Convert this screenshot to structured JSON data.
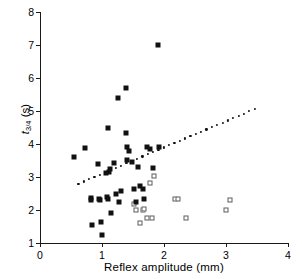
{
  "chart_data": {
    "type": "scatter",
    "title": "",
    "xlabel": "Reflex amplitude (mm)",
    "ylabel_parts": {
      "symbol": "t",
      "subscript": "3/4",
      "units": "(s)"
    },
    "ylabel": "t3/4 (s)",
    "xlim": [
      0,
      4
    ],
    "ylim": [
      1,
      8
    ],
    "xticks": [
      0,
      1,
      2,
      3,
      4
    ],
    "yticks": [
      1,
      2,
      3,
      4,
      5,
      6,
      7,
      8
    ],
    "xtick_labels": [
      "0",
      "1",
      "2",
      "3",
      "4"
    ],
    "ytick_labels": [
      "1",
      "2",
      "3",
      "4",
      "5",
      "6",
      "7",
      "8"
    ],
    "grid": false,
    "legend_position": "none",
    "series": [
      {
        "name": "filled-squares",
        "marker": "filled square",
        "color": "#111111",
        "points": [
          [
            0.55,
            3.6
          ],
          [
            0.72,
            3.89
          ],
          [
            0.82,
            2.35
          ],
          [
            0.83,
            2.3
          ],
          [
            0.84,
            1.55
          ],
          [
            0.93,
            3.38
          ],
          [
            0.95,
            2.32
          ],
          [
            0.97,
            2.3
          ],
          [
            0.98,
            1.64
          ],
          [
            1.0,
            1.25
          ],
          [
            1.07,
            3.11
          ],
          [
            1.08,
            2.38
          ],
          [
            1.09,
            2.33
          ],
          [
            1.1,
            4.49
          ],
          [
            1.12,
            3.16
          ],
          [
            1.13,
            3.25
          ],
          [
            1.14,
            1.9
          ],
          [
            1.2,
            3.43
          ],
          [
            1.22,
            2.49
          ],
          [
            1.25,
            5.38
          ],
          [
            1.27,
            2.25
          ],
          [
            1.3,
            2.58
          ],
          [
            1.38,
            5.7
          ],
          [
            1.39,
            4.34
          ],
          [
            1.4,
            3.9
          ],
          [
            1.41,
            3.52
          ],
          [
            1.43,
            3.79
          ],
          [
            1.48,
            3.46
          ],
          [
            1.52,
            2.64
          ],
          [
            1.55,
            2.25
          ],
          [
            1.58,
            3.3
          ],
          [
            1.62,
            2.72
          ],
          [
            1.66,
            2.64
          ],
          [
            1.68,
            2.33
          ],
          [
            1.72,
            3.92
          ],
          [
            1.78,
            3.84
          ],
          [
            1.82,
            3.28
          ],
          [
            1.9,
            7.0
          ],
          [
            1.92,
            3.9
          ]
        ]
      },
      {
        "name": "open-squares",
        "marker": "open square",
        "color": "#5d5d5d",
        "points": [
          [
            1.52,
            2.17
          ],
          [
            1.55,
            2.0
          ],
          [
            1.62,
            1.62
          ],
          [
            1.66,
            2.0
          ],
          [
            1.68,
            2.02
          ],
          [
            1.72,
            1.77
          ],
          [
            1.78,
            2.82
          ],
          [
            1.8,
            1.76
          ],
          [
            1.84,
            3.03
          ],
          [
            2.18,
            2.34
          ],
          [
            2.22,
            2.34
          ],
          [
            2.35,
            1.77
          ],
          [
            3.0,
            2.0
          ],
          [
            3.07,
            2.31
          ]
        ]
      }
    ],
    "fit_line": {
      "name": "regression-line",
      "style": "dotted",
      "x_start": 0.62,
      "y_start": 2.8,
      "x_end": 3.46,
      "y_end": 5.06,
      "n_dots": 34
    }
  }
}
